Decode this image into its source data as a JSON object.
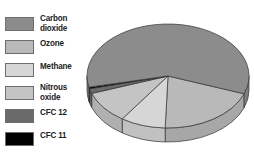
{
  "chart_data": {
    "type": "pie",
    "style": "3d",
    "title": "",
    "legend_position": "left",
    "categories": [
      "Carbon dioxide",
      "Ozone",
      "Methane",
      "Nitrous oxide",
      "CFC 12",
      "CFC 11"
    ],
    "values": [
      59,
      20,
      9,
      10,
      1.5,
      0.5
    ],
    "unit": "percent (estimated)",
    "colors": [
      "#8c8c8c",
      "#b9b9b9",
      "#d6d6d6",
      "#c4c4c4",
      "#6a6a6a",
      "#000000"
    ]
  },
  "legend": {
    "items": [
      {
        "label": "Carbon\ndioxide",
        "color": "#8c8c8c",
        "top": 17,
        "two_line": true
      },
      {
        "label": "Ozone",
        "color": "#b9b9b9",
        "top": 40,
        "two_line": false
      },
      {
        "label": "Methane",
        "color": "#d6d6d6",
        "top": 63,
        "two_line": false
      },
      {
        "label": "Nitrous\noxide",
        "color": "#c4c4c4",
        "top": 86,
        "two_line": true
      },
      {
        "label": "CFC 12",
        "color": "#6a6a6a",
        "top": 109,
        "two_line": false
      },
      {
        "label": "CFC 11",
        "color": "#000000",
        "top": 132,
        "two_line": false
      }
    ]
  }
}
